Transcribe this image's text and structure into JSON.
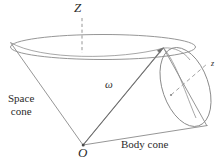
{
  "figure": {
    "background_color": "#ffffff",
    "line_color": "#8a8a8a",
    "text_color": "#2b2b2b",
    "labels": {
      "z_axis": "Z",
      "omega_vector": "ω",
      "origin": "O",
      "space_cone_line1": "Space",
      "space_cone_line2": "cone",
      "body_cone": "Body cone",
      "body_axis": "z"
    },
    "geometry": {
      "origin_point": [
        83,
        145
      ],
      "contact_point": [
        163,
        48
      ],
      "space_cone_ellipse": {
        "center": [
          103,
          47
        ],
        "rx": 90,
        "ry": 13,
        "note": "upper rim of space cone, dashed Z axis through center"
      },
      "body_cone_ellipse": {
        "center": [
          185,
          87
        ],
        "rx": 24,
        "ry": 41,
        "rotation_deg": -20,
        "note": "rim of body cone seen edge-on"
      },
      "space_cone_left_rim": [
        10,
        42
      ],
      "body_cone_lower_vertex": [
        207,
        126
      ],
      "z_axis_dashed_top": [
        82,
        18
      ],
      "z_axis_dashed_bottom": [
        82,
        52
      ],
      "leader_line_from": [
        172,
        95
      ],
      "leader_line_to": [
        208,
        64
      ]
    }
  }
}
